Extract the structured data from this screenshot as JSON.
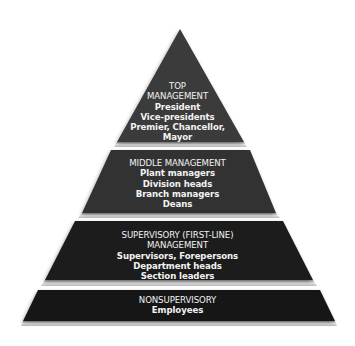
{
  "diagram": {
    "type": "pyramid",
    "colors": {
      "background": "#ffffff",
      "top_layer": "#3a3a3a",
      "middle_layer": "#333333",
      "supervisory_layer": "#1d1d1d",
      "nonsupervisory_layer": "#171717",
      "text": "#f2f2f2",
      "bevel": "#cfcfcf"
    },
    "layers": [
      {
        "id": "top",
        "heading_lines": [
          "TOP",
          "MANAGEMENT"
        ],
        "items": [
          "President",
          "Vice-presidents",
          "Premier, Chancellor,",
          "Mayor"
        ]
      },
      {
        "id": "middle",
        "heading_lines": [
          "MIDDLE MANAGEMENT"
        ],
        "items": [
          "Plant managers",
          "Division heads",
          "Branch managers",
          "Deans"
        ]
      },
      {
        "id": "supervisory",
        "heading_lines": [
          "SUPERVISORY (FIRST-LINE)",
          "MANAGEMENT"
        ],
        "items": [
          "Supervisors, Forepersons",
          "Department heads",
          "Section leaders"
        ]
      },
      {
        "id": "nonsupervisory",
        "heading_lines": [
          "NONSUPERVISORY"
        ],
        "items": [
          "Employees"
        ]
      }
    ]
  }
}
